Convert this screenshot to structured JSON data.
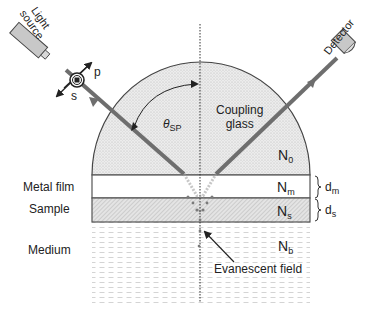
{
  "diagram": {
    "components": {
      "light_source": {
        "label_line1": "Light",
        "label_line2": "source"
      },
      "detector": {
        "label": "Detector"
      },
      "polarization": {
        "p": "p",
        "s": "s"
      },
      "angle": {
        "symbol": "θ",
        "subscript": "SP"
      },
      "coupling_glass": {
        "line1": "Coupling",
        "line2": "glass"
      }
    },
    "layers": [
      {
        "name": "Coupling glass",
        "index_symbol": "N",
        "index_sub": "0"
      },
      {
        "name": "Metal film",
        "index_symbol": "N",
        "index_sub": "m",
        "thickness_symbol": "d",
        "thickness_sub": "m"
      },
      {
        "name": "Sample",
        "index_symbol": "N",
        "index_sub": "s",
        "thickness_symbol": "d",
        "thickness_sub": "s"
      },
      {
        "name": "Medium",
        "index_symbol": "N",
        "index_sub": "b"
      }
    ],
    "annotations": {
      "evanescent_field": "Evanescent field"
    },
    "colors": {
      "beam": "#6e6e6e",
      "outline": "#444444",
      "glass_fill": "#e6e6e6",
      "metal_fill": "#ffffff",
      "sample_fill": "#dcdcdc",
      "medium_dash": "#c8c8c8",
      "device_fill": "#c8c8c8"
    }
  }
}
